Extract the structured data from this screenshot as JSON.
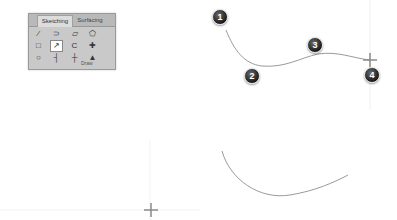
{
  "ribbon": {
    "tabs": [
      {
        "label": "Sketching",
        "active": true
      },
      {
        "label": "Surfacing",
        "active": false
      }
    ],
    "tools": [
      {
        "name": "line",
        "glyph": "⁄"
      },
      {
        "name": "arc",
        "glyph": "⊃"
      },
      {
        "name": "polyline",
        "glyph": "▱"
      },
      {
        "name": "polygon",
        "glyph": "⬠"
      },
      {
        "name": "rectangle",
        "glyph": "□"
      },
      {
        "name": "spline",
        "glyph": "↗",
        "selected": true
      },
      {
        "name": "offset",
        "glyph": "C"
      },
      {
        "name": "point",
        "glyph": "✚"
      },
      {
        "name": "circle",
        "glyph": "○"
      },
      {
        "name": "trim",
        "glyph": "┤"
      },
      {
        "name": "extend",
        "glyph": "┼"
      },
      {
        "name": "construction",
        "glyph": "▲"
      }
    ],
    "group_label": "Draw"
  },
  "markers": [
    {
      "label": "1",
      "x": 212,
      "y": 9
    },
    {
      "label": "2",
      "x": 244,
      "y": 68
    },
    {
      "label": "3",
      "x": 307,
      "y": 37
    },
    {
      "label": "4",
      "x": 364,
      "y": 67
    }
  ],
  "colors": {
    "curve": "#9a9a9a",
    "crosshair": "#8a8a8a",
    "guide": "#eeeeee"
  }
}
